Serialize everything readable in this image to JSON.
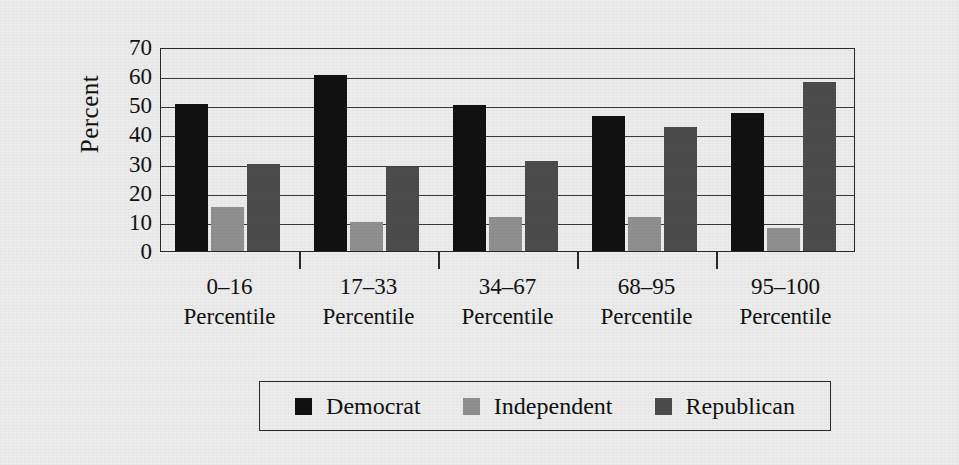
{
  "chart_data": {
    "type": "bar",
    "title": "",
    "xlabel": "",
    "ylabel": "Percent",
    "ylim": [
      0,
      70
    ],
    "yticks": [
      0,
      10,
      20,
      30,
      40,
      50,
      60,
      70
    ],
    "grid": true,
    "legend_position": "bottom",
    "categories": [
      "0–16\nPercentile",
      "17–33\nPercentile",
      "34–67\nPercentile",
      "68–95\nPercentile",
      "95–100\nPercentile"
    ],
    "category_ranges": [
      "0–16",
      "17–33",
      "34–67",
      "68–95",
      "95–100"
    ],
    "category_unit": "Percentile",
    "series": [
      {
        "name": "Democrat",
        "color": "#111111",
        "values": [
          50.5,
          60.5,
          50.0,
          46.5,
          47.5
        ]
      },
      {
        "name": "Independent",
        "color": "#8f8f8f",
        "values": [
          15.0,
          9.8,
          11.8,
          11.8,
          8.0
        ]
      },
      {
        "name": "Republican",
        "color": "#4c4c4c",
        "values": [
          30.0,
          28.8,
          31.0,
          42.5,
          58.0
        ]
      }
    ]
  },
  "axis": {
    "y_title": "Percent",
    "y_tick_labels": [
      "70",
      "60",
      "50",
      "40",
      "30",
      "20",
      "10",
      "0"
    ]
  },
  "legend": {
    "items": [
      {
        "label": "Democrat",
        "color": "#111111",
        "swatch": "democrat"
      },
      {
        "label": "Independent",
        "color": "#8f8f8f",
        "swatch": "independent"
      },
      {
        "label": "Republican",
        "color": "#4c4c4c",
        "swatch": "republican"
      }
    ]
  },
  "colors": {
    "background": "#ececec",
    "axis": "#2a2a2a",
    "democrat": "#111111",
    "independent": "#8f8f8f",
    "republican": "#4c4c4c"
  }
}
